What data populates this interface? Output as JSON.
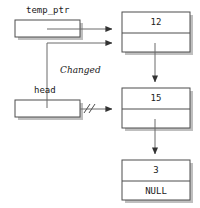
{
  "diagram": {
    "stroke_color": "#4d4d4d",
    "shadow_color": "#b3b3b3",
    "text_color": "#1a1a1a",
    "background": "#ffffff",
    "pointer_vars": [
      {
        "id": "temp_ptr",
        "label": "temp_ptr",
        "box": {
          "x": 15,
          "y": 20,
          "w": 65,
          "h": 17
        },
        "label_pos": {
          "x": 26,
          "y": 8
        }
      },
      {
        "id": "head",
        "label": "head",
        "box": {
          "x": 15,
          "y": 100,
          "w": 65,
          "h": 17
        },
        "label_pos": {
          "x": 34,
          "y": 88
        }
      }
    ],
    "annotations": [
      {
        "id": "changed",
        "text": "Changed",
        "italic": true,
        "pos": {
          "x": 60,
          "y": 68
        }
      },
      {
        "id": "cut-marks",
        "text": "//",
        "pos": {
          "x": 84,
          "y": 103
        }
      }
    ],
    "nodes": [
      {
        "id": "node-1",
        "value": "12",
        "next_text": "",
        "box": {
          "x": 122,
          "y": 12,
          "w": 68,
          "h": 40
        },
        "divider_offset": 21
      },
      {
        "id": "node-2",
        "value": "15",
        "next_text": "",
        "box": {
          "x": 122,
          "y": 88,
          "w": 68,
          "h": 40
        },
        "divider_offset": 21
      },
      {
        "id": "node-3",
        "value": "3",
        "next_text": "NULL",
        "box": {
          "x": 122,
          "y": 160,
          "w": 68,
          "h": 40
        },
        "divider_offset": 21
      }
    ],
    "arrows": [
      {
        "id": "temp-ptr-to-node1",
        "from": "temp_ptr",
        "to": "node-1"
      },
      {
        "id": "head-changed-to-node1",
        "from": "head",
        "to": "node-1"
      },
      {
        "id": "head-old-to-node2",
        "from": "head",
        "to": "node-2",
        "severed": true
      },
      {
        "id": "node1-to-node2",
        "from": "node-1",
        "to": "node-2"
      },
      {
        "id": "node2-to-node3",
        "from": "node-2",
        "to": "node-3"
      }
    ]
  }
}
